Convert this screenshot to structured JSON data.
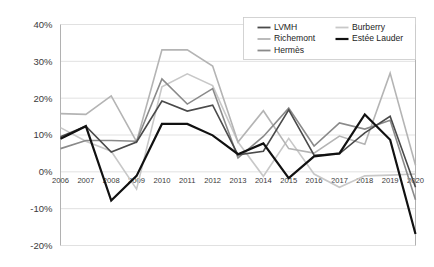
{
  "chart_data": {
    "type": "line",
    "title": "",
    "subtitle": "",
    "xlabel": "",
    "ylabel": "",
    "grid": "horizontal",
    "legend_position": "top-right",
    "categories": [
      "2006",
      "2007",
      "2008",
      "2009",
      "2010",
      "2011",
      "2012",
      "2013",
      "2014",
      "2015",
      "2016",
      "2017",
      "2018",
      "2019",
      "2020"
    ],
    "x": [
      2006,
      2007,
      2008,
      2009,
      2010,
      2011,
      2012,
      2013,
      2014,
      2015,
      2016,
      2017,
      2018,
      2019,
      2020
    ],
    "ylim": [
      -20,
      40
    ],
    "ytick_labels": [
      "40%",
      "30%",
      "20%",
      "10%",
      "0%",
      "-10%",
      "-20%"
    ],
    "ytick_values": [
      40,
      30,
      20,
      10,
      0,
      -10,
      -20
    ],
    "yunit": "%",
    "series": [
      {
        "name": "LVMH",
        "color": "#4a4a4a",
        "width": 1.6,
        "values": [
          9.5,
          12.4,
          5.4,
          8.1,
          19.2,
          16.5,
          18.1,
          4.6,
          5.6,
          16.8,
          4.5,
          4.9,
          10.6,
          15.1,
          -4.2
        ]
      },
      {
        "name": "Richemont",
        "color": "#b4b4b4",
        "width": 1.6,
        "values": [
          15.8,
          15.6,
          20.6,
          8.2,
          33.1,
          33.1,
          28.7,
          8.1,
          16.6,
          6.3,
          5.1,
          9.7,
          7.5,
          26.8,
          1.8
        ]
      },
      {
        "name": "Hermès",
        "color": "#8a8a8a",
        "width": 1.6,
        "values": [
          6.3,
          8.5,
          8.5,
          8.3,
          25.2,
          18.4,
          22.6,
          3.8,
          9.6,
          17.3,
          7.0,
          13.3,
          11.6,
          14.0,
          -7.6
        ]
      },
      {
        "name": "Burberry",
        "color": "#c8c8c8",
        "width": 1.6,
        "values": [
          12.0,
          8.3,
          5.6,
          -4.7,
          23.1,
          26.6,
          23.4,
          8.1,
          -1.2,
          9.1,
          -0.6,
          -4.2,
          -1.1,
          -0.9,
          -0.6
        ]
      },
      {
        "name": "Estée Lauder",
        "color": "#111111",
        "width": 2.2,
        "values": [
          9.0,
          12.4,
          -7.8,
          -1.1,
          13.0,
          13.0,
          9.9,
          4.8,
          7.7,
          -1.7,
          4.2,
          5.0,
          15.6,
          8.7,
          -16.9
        ]
      }
    ]
  },
  "legend": {
    "entries": [
      {
        "label": "LVMH"
      },
      {
        "label": "Burberry"
      },
      {
        "label": "Richemont"
      },
      {
        "label": "Estée Lauder"
      },
      {
        "label": "Hermès"
      }
    ]
  }
}
